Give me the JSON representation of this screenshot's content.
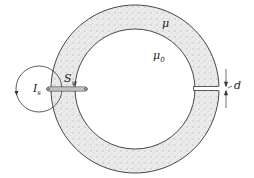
{
  "diagram": {
    "labels": {
      "mu_core": "μ",
      "mu_gap": "μ",
      "mu_gap_sub": "0",
      "current": "I",
      "current_sub": "s",
      "switch": "S",
      "switch_sub": "ψ",
      "gap_width": "d"
    },
    "colors": {
      "stroke": "#333333",
      "core_fill": "#e4e4e4"
    }
  }
}
